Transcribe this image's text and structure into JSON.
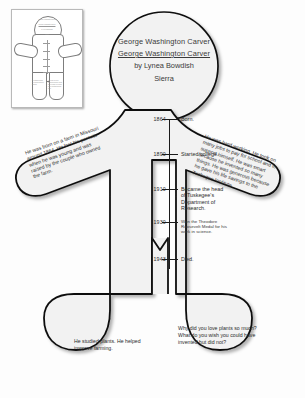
{
  "document": {
    "type": "body-biography-worksheet",
    "bottom_caption": ""
  },
  "thumbnail": {
    "name": "page-thumbnail",
    "head_text": "George Washington Carver",
    "head_subtext": "George Washington Carver",
    "head_author": "by Lynea Bowdish",
    "head_student": "Sierra",
    "leg_left_text": "He studied plants. He helped improve farming.",
    "leg_right_text": "Why did you love plants so much? What do you wish you could have invented but did not?"
  },
  "head": {
    "book_title": "George Washington Carver",
    "title_repeat": "George Washington Carver",
    "author": "by Lynea Bowdish",
    "student_name": "Sierra"
  },
  "timeline": {
    "events": [
      {
        "year": "1864",
        "label": "Born.",
        "detail": ""
      },
      {
        "year": "1890",
        "label": "Started college.",
        "detail": ""
      },
      {
        "year": "1910",
        "label": "Became the head of Tuskegee's Department of Research.",
        "detail": ""
      },
      {
        "year": "1930",
        "label": "",
        "detail": "Won the Theodore Roosevelt Medal for his work in science."
      },
      {
        "year": "1943",
        "label": "Died.",
        "detail": ""
      }
    ]
  },
  "arms": {
    "left_text": "He was born on a farm in Missouri around 1864. He lost his parents when he was young and was raised by the couple who owned the farm.",
    "right_text": "He was hard working. He took on many jobs to pay for school and to support himself. He was smart because he invented so many things. He was generous because he gave his life savings to the Tuskegee Institute."
  },
  "legs": {
    "left_text": "He studied plants. He helped improve farming.",
    "right_text": "Why did you love plants so much? What do you wish you could have invented but did not?"
  },
  "colors": {
    "outline": "#111111",
    "fill": "#f2f2f2",
    "page_background": "#ffffff",
    "text": "#2a2a2a"
  }
}
